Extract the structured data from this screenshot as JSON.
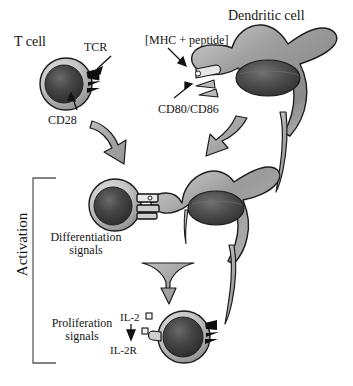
{
  "figure": {
    "background": "#ffffff",
    "width": 353,
    "height": 386
  },
  "labels": {
    "t_cell": "T cell",
    "tcr": "TCR",
    "cd28": "CD28",
    "dendritic_cell": "Dendritic cell",
    "mhc_peptide": "[MHC + peptide]",
    "cd80_cd86": "CD80/CD86",
    "differentiation_signals": "Differentiation\nsignals",
    "differentiation_line1": "Differentiation",
    "differentiation_line2": "signals",
    "proliferation_line1": "Proliferation",
    "proliferation_line2": "signals",
    "il2": "IL-2",
    "il2r": "IL-2R",
    "activation": "Activation"
  },
  "colors": {
    "outline": "#1a1a1a",
    "cell_membrane_light": "#c9c9c9",
    "cell_membrane_mid": "#9a9a9a",
    "nucleus_dark": "#3a3a3a",
    "nucleus_core": "#2a2a2a",
    "dendritic_body": "#8f8f8f",
    "dendritic_body_light": "#cfcfcf",
    "arrow_fill": "#a8a8a8",
    "receptor_black": "#0d0d0d",
    "bracket": "#555555",
    "text": "#141414"
  },
  "elements": {
    "t_cell_top": {
      "cx": 66,
      "cy": 84,
      "r": 26
    },
    "dendritic_cell_top": {
      "cx": 265,
      "cy": 72
    },
    "t_cell_middle": {
      "cx": 115,
      "cy": 205,
      "r": 26
    },
    "dendritic_cell_middle": {
      "cx": 215,
      "cy": 210
    },
    "t_cell_bottom": {
      "cx": 184,
      "cy": 337,
      "r": 26
    },
    "arrow_left_curved": "curved arrow from T cell down-right",
    "arrow_right_curved": "curved arrow from dendritic cell down-left",
    "arrow_funnel_down": "funnel shaped downward arrow",
    "il2_molecules": 3,
    "activation_bracket": {
      "top": 178,
      "bottom": 363,
      "x": 33
    }
  }
}
